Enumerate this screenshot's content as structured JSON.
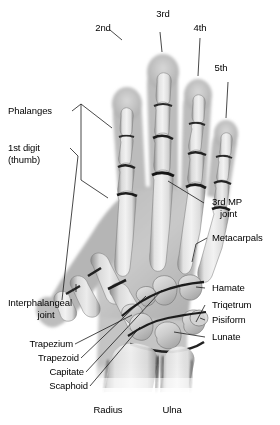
{
  "figure": {
    "type": "anatomical-illustration",
    "view": "posteroanterior",
    "background_color": "#ffffff",
    "text_color": "#000000",
    "leader_line_color": "#1a1a1a"
  },
  "labels": {
    "digit_2": "2nd",
    "digit_3": "3rd",
    "digit_4": "4th",
    "digit_5": "5th",
    "phalanges": "Phalanges",
    "first_digit_line1": "1st digit",
    "first_digit_line2": "(thumb)",
    "third_mp_line1": "3rd MP",
    "third_mp_line2": "joint",
    "metacarpals": "Metacarpals",
    "hamate": "Hamate",
    "triquetrum": "Triqetrum",
    "pisiform": "Pisiform",
    "lunate": "Lunate",
    "interphalangeal_line1": "Interphalangeal",
    "interphalangeal_line2": "joint",
    "trapezium": "Trapezium",
    "trapezoid": "Trapezoid",
    "capitate": "Capitate",
    "scaphoid": "Scaphoid",
    "radius": "Radius",
    "ulna": "Ulna"
  }
}
